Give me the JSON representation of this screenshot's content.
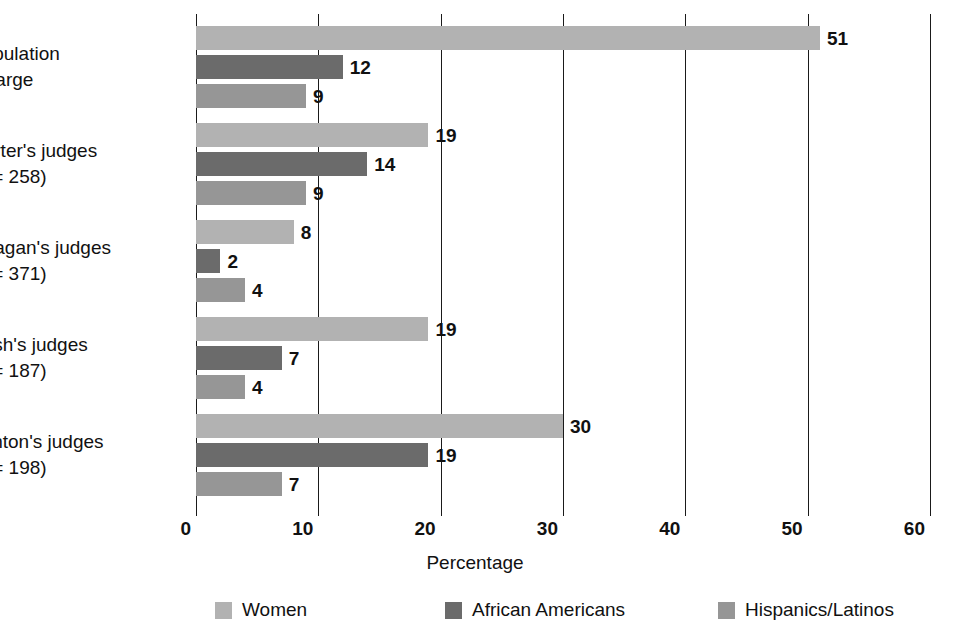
{
  "chart_data": {
    "type": "bar",
    "orientation": "horizontal",
    "title": "",
    "xlabel": "Percentage",
    "ylabel": "",
    "xlim": [
      0,
      60
    ],
    "xticks": [
      0,
      10,
      20,
      30,
      40,
      50,
      60
    ],
    "xtick_labels": [
      "0",
      "10",
      "20",
      "30",
      "40",
      "50",
      "60"
    ],
    "grid": true,
    "grid_axis": "x",
    "legend_position": "bottom",
    "categories": [
      "Population at large",
      "Carter's judges (n = 258)",
      "Reagan's judges (n = 371)",
      "Bush's judges (n = 187)",
      "Clinton's judges (n = 198)"
    ],
    "series": [
      {
        "name": "Women",
        "color": "#b2b2b2",
        "values": [
          51,
          19,
          8,
          19,
          30
        ]
      },
      {
        "name": "African Americans",
        "color": "#6b6b6b",
        "values": [
          12,
          14,
          2,
          7,
          19
        ]
      },
      {
        "name": "Hispanics/Latinos",
        "color": "#969696",
        "values": [
          9,
          9,
          4,
          4,
          7
        ]
      }
    ]
  },
  "groups": [
    {
      "label_line1": "Population",
      "label_line2": "at large",
      "has_n": false,
      "n_prefix": "",
      "n_value": "",
      "bars": [
        {
          "series": "Women",
          "value": 51,
          "label": "51"
        },
        {
          "series": "African Americans",
          "value": 12,
          "label": "12"
        },
        {
          "series": "Hispanics/Latinos",
          "value": 9,
          "label": "9"
        }
      ]
    },
    {
      "label_line1": "Carter's judges",
      "label_line2": "",
      "has_n": true,
      "n_prefix": "n",
      "n_value": " = 258)",
      "bars": [
        {
          "series": "Women",
          "value": 19,
          "label": "19"
        },
        {
          "series": "African Americans",
          "value": 14,
          "label": "14"
        },
        {
          "series": "Hispanics/Latinos",
          "value": 9,
          "label": "9"
        }
      ]
    },
    {
      "label_line1": "Reagan's judges",
      "label_line2": "",
      "has_n": true,
      "n_prefix": "n",
      "n_value": " = 371)",
      "bars": [
        {
          "series": "Women",
          "value": 8,
          "label": "8"
        },
        {
          "series": "African Americans",
          "value": 2,
          "label": "2"
        },
        {
          "series": "Hispanics/Latinos",
          "value": 4,
          "label": "4"
        }
      ]
    },
    {
      "label_line1": "Bush's judges",
      "label_line2": "",
      "has_n": true,
      "n_prefix": "n",
      "n_value": " = 187)",
      "bars": [
        {
          "series": "Women",
          "value": 19,
          "label": "19"
        },
        {
          "series": "African Americans",
          "value": 7,
          "label": "7"
        },
        {
          "series": "Hispanics/Latinos",
          "value": 4,
          "label": "4"
        }
      ]
    },
    {
      "label_line1": "Clinton's judges",
      "label_line2": "",
      "has_n": true,
      "n_prefix": "n",
      "n_value": " = 198)",
      "bars": [
        {
          "series": "Women",
          "value": 30,
          "label": "30"
        },
        {
          "series": "African Americans",
          "value": 19,
          "label": "19"
        },
        {
          "series": "Hispanics/Latinos",
          "value": 7,
          "label": "7"
        }
      ]
    }
  ],
  "axis": {
    "x_title": "Percentage",
    "ticks": [
      "0",
      "10",
      "20",
      "30",
      "40",
      "50",
      "60"
    ]
  },
  "legend": {
    "items": [
      {
        "label": "Women",
        "color": "#b2b2b2"
      },
      {
        "label": "African Americans",
        "color": "#6b6b6b"
      },
      {
        "label": "Hispanics/Latinos",
        "color": "#969696"
      }
    ]
  }
}
